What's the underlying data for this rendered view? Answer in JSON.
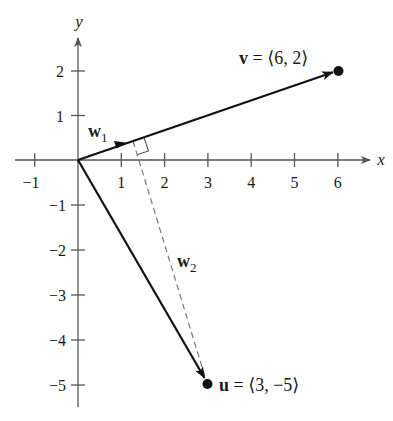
{
  "figure": {
    "type": "vector-projection-diagram",
    "axes": {
      "x_label": "x",
      "y_label": "y",
      "x_ticks": [
        "−1",
        "1",
        "2",
        "3",
        "4",
        "5",
        "6"
      ],
      "x_tick_values": [
        -1,
        1,
        2,
        3,
        4,
        5,
        6
      ],
      "y_ticks": [
        "2",
        "1",
        "−1",
        "−2",
        "−3",
        "−4",
        "−5"
      ],
      "y_tick_values": [
        2,
        1,
        -1,
        -2,
        -3,
        -4,
        -5
      ],
      "x_range": [
        -1.5,
        6.8
      ],
      "y_range": [
        -5.5,
        2.8
      ]
    },
    "vectors": {
      "v": {
        "name": "v",
        "label_text": " = ⟨6, 2⟩",
        "components": [
          6,
          2
        ]
      },
      "u": {
        "name": "u",
        "label_text": " = ⟨3, −5⟩",
        "components": [
          3,
          -5
        ]
      },
      "w1": {
        "name": "w",
        "subscript": "1",
        "description": "projection of u onto v",
        "components": [
          1.2,
          0.4
        ]
      },
      "w2": {
        "name": "w",
        "subscript": "2",
        "description": "u − w1 (dashed, perpendicular to v)",
        "components": [
          1.8,
          -5.4
        ]
      }
    },
    "colors": {
      "axis": "#555555",
      "vector": "#111111",
      "dashed": "#777777",
      "background": "#ffffff"
    }
  }
}
